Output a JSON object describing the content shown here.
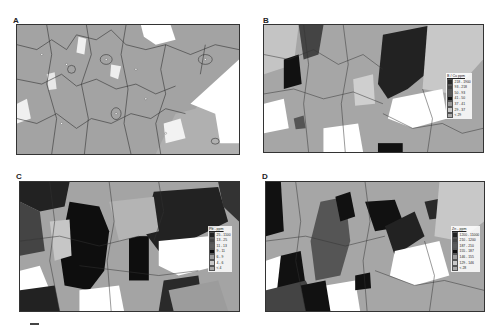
{
  "panels": [
    {
      "id": "A",
      "label": "A",
      "variable": "elevation / topography base map",
      "legend": null
    },
    {
      "id": "B",
      "label": "B",
      "legend": {
        "title": "B / Cu ppm",
        "classes": [
          {
            "range": "218 - 1900",
            "color": "#2a2a2a"
          },
          {
            "range": "93 - 218",
            "color": "#404040"
          },
          {
            "range": "50 - 93",
            "color": "#585858"
          },
          {
            "range": "41 - 50",
            "color": "#111111"
          },
          {
            "range": "37 - 41",
            "color": "#9a9a9a"
          },
          {
            "range": "29 - 37",
            "color": "#c8c8c8"
          },
          {
            "range": "< 29",
            "color": "#a8a8a8"
          }
        ]
      }
    },
    {
      "id": "C",
      "label": "C",
      "legend": {
        "title": "Pb - ppm",
        "classes": [
          {
            "range": "25 - 1100",
            "color": "#222222"
          },
          {
            "range": "13 - 25",
            "color": "#444444"
          },
          {
            "range": "11 - 13",
            "color": "#5a5a5a"
          },
          {
            "range": "9 - 11",
            "color": "#0e0e0e"
          },
          {
            "range": "6 - 9",
            "color": "#9c9c9c"
          },
          {
            "range": "4 - 6",
            "color": "#c8c8c8"
          },
          {
            "range": "< 4",
            "color": "#a8a8a8"
          }
        ]
      }
    },
    {
      "id": "D",
      "label": "D",
      "legend": {
        "title": "Zn - ppm",
        "classes": [
          {
            "range": "1200 - 11000",
            "color": "#222222"
          },
          {
            "range": "210 - 1200",
            "color": "#444444"
          },
          {
            "range": "187 - 210",
            "color": "#5a5a5a"
          },
          {
            "range": "155 - 187",
            "color": "#0e0e0e"
          },
          {
            "range": "146 - 155",
            "color": "#9c9c9c"
          },
          {
            "range": "129 - 146",
            "color": "#c8c8c8"
          },
          {
            "range": "< 28",
            "color": "#a8a8a8"
          }
        ]
      }
    }
  ],
  "colors": {
    "frame": "#333333",
    "base_gray": "#a0a0a0",
    "light_gray": "#c8c8c8",
    "white": "#ffffff",
    "dark": "#111111"
  }
}
